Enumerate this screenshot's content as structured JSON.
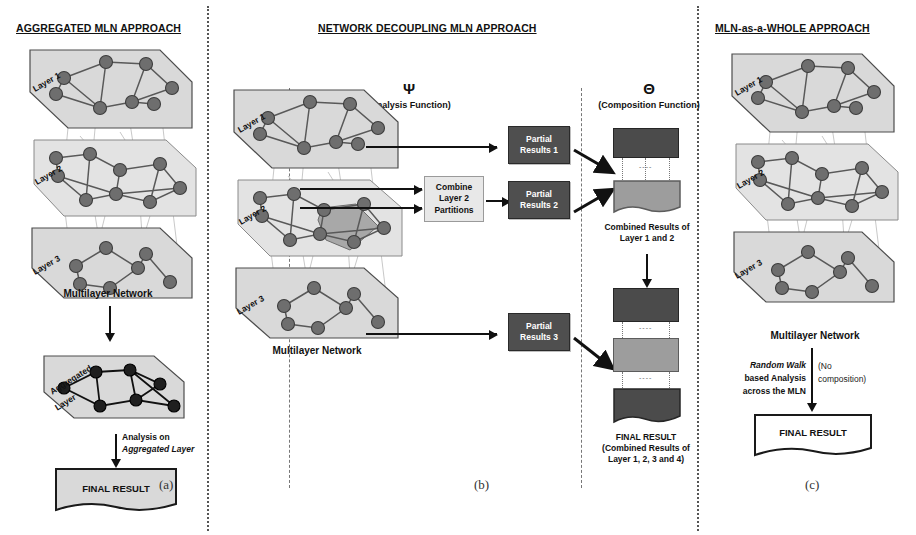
{
  "figure": {
    "caption_a": "(a)",
    "caption_b": "(b)",
    "caption_c": "(c)"
  },
  "panel_a": {
    "title": "AGGREGATED MLN APPROACH",
    "layer_labels": [
      "Layer 1",
      "Layer 2",
      "Layer 3"
    ],
    "network_caption": "Multilayer Network",
    "aggregated_label": "Aggregated\nLayer",
    "aggregated_label_line1": "Aggregated",
    "aggregated_label_line2": "Layer",
    "analysis_line1": "Analysis on",
    "analysis_line2": "Aggregated Layer",
    "final_result": "FINAL RESULT"
  },
  "panel_b": {
    "title": "NETWORK DECOUPLING MLN APPROACH",
    "layer_labels": [
      "Layer 1",
      "Layer 2",
      "Layer 3"
    ],
    "network_caption": "Multilayer Network",
    "analysis_symbol": "Ψ",
    "analysis_function_label": "(Analysis Function)",
    "composition_symbol": "Θ",
    "composition_function_label": "(Composition  Function)",
    "combine_box_line1": "Combine",
    "combine_box_line2": "Layer 2",
    "combine_box_line3": "Partitions",
    "partial_results": [
      {
        "line1": "Partial",
        "line2": "Results 1"
      },
      {
        "line1": "Partial",
        "line2": "Results 2"
      },
      {
        "line1": "Partial",
        "line2": "Results 3"
      }
    ],
    "combined_caption_line1": "Combined Results of",
    "combined_caption_line2": "Layer 1 and 2",
    "final_caption_line1": "FINAL RESULT",
    "final_caption_line2": "(Combined Results of",
    "final_caption_line3": "Layer 1, 2, 3 and 4)"
  },
  "panel_c": {
    "title": "MLN-as-a-WHOLE  APPROACH",
    "layer_labels": [
      "Layer 1",
      "Layer 2",
      "Layer 3"
    ],
    "network_caption": "Multilayer Network",
    "analysis_line1": "Random Walk",
    "analysis_line2": "based Analysis",
    "analysis_line3": "across the MLN",
    "note_line1": "(No",
    "note_line2": "composition)",
    "final_result": "FINAL RESULT"
  },
  "colors": {
    "layer_fill": "#d9d9d9",
    "node_fill": "#6e6e6e",
    "dark_box": "#4f4f4f",
    "mid_box": "#9d9d9d",
    "divider": "#555555"
  }
}
